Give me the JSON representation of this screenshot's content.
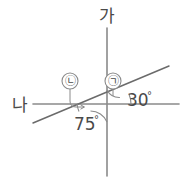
{
  "figure": {
    "background_color": "#ffffff",
    "line_color": "#8a8a8a",
    "text_color": "#4a4a4a"
  },
  "axes": {
    "vertical": {
      "label": "가",
      "label_x": 107,
      "label_y": 20,
      "x": 107,
      "y_top": 28,
      "y_bottom": 176
    },
    "horizontal": {
      "label": "나",
      "label_x": 20,
      "label_y": 110,
      "y": 104,
      "x_left": 33,
      "x_right": 179
    }
  },
  "transversal": {
    "name": "diagonal-line",
    "x1": 33,
    "y1": 123,
    "x2": 169,
    "y2": 66
  },
  "intersection": {
    "x": 107,
    "y": 104
  },
  "angles": [
    {
      "id": "angle-30",
      "label": "30",
      "degree_symbol": "°",
      "value": 30,
      "label_x": 133,
      "label_y": 105,
      "between": "horizontal-right and diagonal-up-right"
    },
    {
      "id": "angle-75",
      "label": "75",
      "degree_symbol": "°",
      "value": 75,
      "label_x": 80,
      "label_y": 130,
      "between": "diagonal-down-left and vertical-down"
    }
  ],
  "markers": [
    {
      "id": "marker-giyeok",
      "label": "㉠",
      "circle_x": 113,
      "circle_y": 81,
      "radius": 8,
      "points_to": "angle between vertical-up and diagonal-up-right"
    },
    {
      "id": "marker-nieun",
      "label": "㉡",
      "circle_x": 70,
      "circle_y": 81,
      "radius": 8,
      "points_to": "angle between horizontal-left and diagonal-down-left"
    }
  ]
}
